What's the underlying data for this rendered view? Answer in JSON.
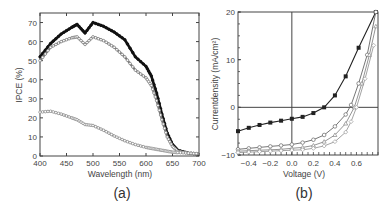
{
  "chart_data": [
    {
      "type": "line",
      "panel_label": "(a)",
      "title": "",
      "xlabel": "Wavelength (nm)",
      "ylabel": "IPCE (%)",
      "xlim": [
        400,
        700
      ],
      "ylim": [
        0,
        75
      ],
      "xticks": [
        400,
        450,
        500,
        550,
        600,
        650,
        700
      ],
      "yticks": [
        0,
        10,
        20,
        30,
        40,
        50,
        60,
        70
      ],
      "grid": false,
      "legend": null,
      "x": [
        400,
        420,
        440,
        460,
        470,
        485,
        500,
        520,
        540,
        560,
        580,
        600,
        610,
        620,
        630,
        640,
        650,
        660,
        680,
        700
      ],
      "series": [
        {
          "name": "series-1 (filled circles, black)",
          "color": "#111111",
          "values": [
            52,
            59,
            64,
            67.5,
            69,
            64.5,
            70,
            68,
            65,
            61,
            52,
            47,
            42,
            33,
            22,
            12,
            6,
            3,
            1.5,
            1
          ]
        },
        {
          "name": "series-2 (open circles, grey)",
          "color": "#777777",
          "values": [
            50,
            57,
            60,
            62,
            62.5,
            58.5,
            62.5,
            60.5,
            57,
            52,
            45,
            41,
            37,
            29,
            19,
            10,
            5,
            2.5,
            1.5,
            1
          ]
        },
        {
          "name": "series-3 (open squares, grey)",
          "color": "#888888",
          "values": [
            23,
            23.5,
            22,
            20,
            19,
            16.5,
            16,
            13.5,
            10.5,
            8,
            6,
            4.5,
            4,
            3.5,
            3,
            2.5,
            2,
            1.8,
            1.5,
            1.2
          ]
        }
      ]
    },
    {
      "type": "line",
      "panel_label": "(b)",
      "title": "",
      "xlabel": "Voltage (V)",
      "ylabel": "Currentdensity (mA/cm²)",
      "xlim": [
        -0.5,
        0.8
      ],
      "ylim": [
        -10,
        20
      ],
      "xticks": [
        -0.4,
        -0.2,
        0.0,
        0.2,
        0.4,
        0.6
      ],
      "yticks": [
        -10,
        0,
        10,
        20
      ],
      "grid": false,
      "reference_lines": {
        "x": 0,
        "y": 0
      },
      "legend": null,
      "series": [
        {
          "name": "dark (filled squares)",
          "color": "#222222",
          "x": [
            -0.5,
            -0.4,
            -0.3,
            -0.2,
            -0.1,
            0.0,
            0.1,
            0.2,
            0.3,
            0.4,
            0.5,
            0.62,
            0.78
          ],
          "values": [
            -5,
            -4.3,
            -3.7,
            -3.2,
            -2.8,
            -2.4,
            -2.0,
            -1.2,
            0,
            2.5,
            6.5,
            12.5,
            20
          ]
        },
        {
          "name": "illuminated-1 (open circles)",
          "color": "#666666",
          "x": [
            -0.5,
            -0.4,
            -0.3,
            -0.2,
            -0.1,
            0.0,
            0.1,
            0.2,
            0.3,
            0.4,
            0.5,
            0.55,
            0.62,
            0.7,
            0.78
          ],
          "values": [
            -8.8,
            -8.6,
            -8.4,
            -8.2,
            -8.0,
            -7.8,
            -7.4,
            -6.8,
            -5.8,
            -4.0,
            -1.5,
            0.5,
            5,
            11,
            20
          ]
        },
        {
          "name": "illuminated-2 (open triangles)",
          "color": "#888888",
          "x": [
            -0.5,
            -0.4,
            -0.3,
            -0.2,
            -0.1,
            0.0,
            0.1,
            0.2,
            0.3,
            0.4,
            0.5,
            0.58,
            0.65,
            0.72,
            0.78
          ],
          "values": [
            -9.2,
            -9.1,
            -9.0,
            -8.9,
            -8.8,
            -8.6,
            -8.4,
            -8.0,
            -7.2,
            -5.8,
            -3.4,
            0,
            5,
            11,
            17
          ]
        },
        {
          "name": "illuminated-3 (open diamonds)",
          "color": "#999999",
          "x": [
            -0.5,
            -0.4,
            -0.3,
            -0.2,
            -0.1,
            0.0,
            0.1,
            0.2,
            0.3,
            0.4,
            0.5,
            0.55,
            0.6,
            0.68,
            0.76
          ],
          "values": [
            -9.5,
            -9.4,
            -9.3,
            -9.2,
            -9.1,
            -9.0,
            -8.9,
            -8.6,
            -8.1,
            -7.2,
            -5.2,
            -3.0,
            0,
            6,
            13
          ]
        }
      ]
    }
  ],
  "labels": {
    "a": {
      "panel": "(a)",
      "xlabel": "Wavelength (nm)",
      "ylabel": "IPCE (%)",
      "xticks": [
        "400",
        "450",
        "500",
        "550",
        "600",
        "650",
        "700"
      ],
      "yticks": [
        "0",
        "10",
        "20",
        "30",
        "40",
        "50",
        "60",
        "70"
      ]
    },
    "b": {
      "panel": "(b)",
      "xlabel": "Voltage (V)",
      "ylabel": "Currentdensity (mA/cm²)",
      "xticks": [
        "−0.4",
        "−0.2",
        "0.0",
        "0.2",
        "0.4",
        "0.6"
      ],
      "yticks": [
        "−10",
        "0",
        "10",
        "20"
      ]
    }
  }
}
